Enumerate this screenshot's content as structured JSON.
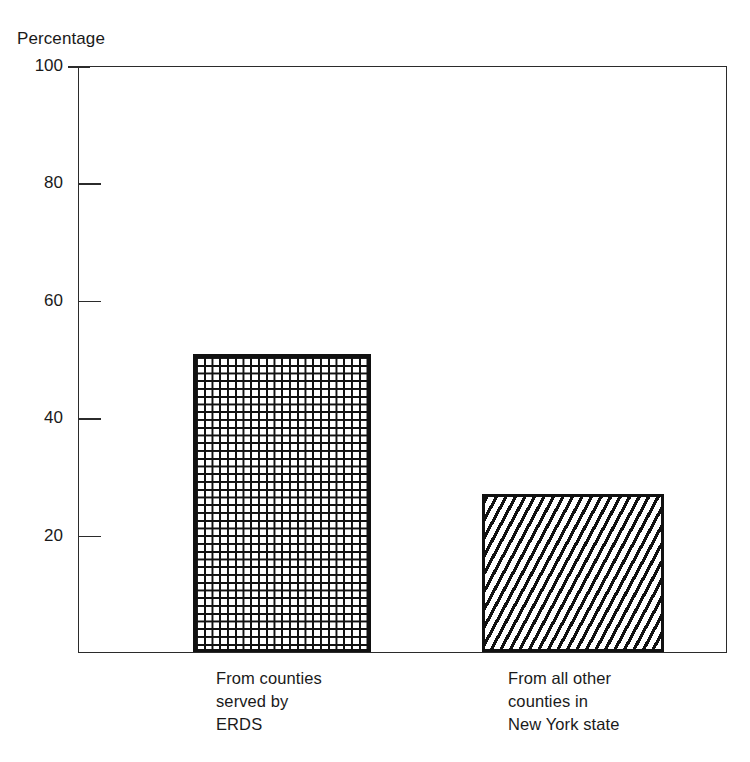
{
  "chart_data": {
    "type": "bar",
    "title": "",
    "subtitle": "",
    "xlabel": "",
    "ylabel": "Percentage",
    "ylim": [
      0,
      100
    ],
    "yticks": [
      100,
      80,
      60,
      40,
      20
    ],
    "ytick_labels": [
      "100",
      "80",
      "60",
      "40",
      "20"
    ],
    "grid": false,
    "legend": null,
    "categories": [
      "From counties\nserved by\nERDS",
      "From all other\ncounties in\nNew York state"
    ],
    "values": [
      51,
      27
    ],
    "bar_patterns": [
      "basketweave",
      "diagonal-hatch"
    ],
    "colors": {
      "line": "#2b2b2b",
      "bar_edge": "#111111",
      "bar_fill": "#ffffff",
      "text": "#1a1a1a",
      "background": "#ffffff"
    }
  },
  "axis": {
    "y_title": "Percentage",
    "ticks": [
      {
        "label": "100",
        "value": 100
      },
      {
        "label": "80",
        "value": 80
      },
      {
        "label": "60",
        "value": 60
      },
      {
        "label": "40",
        "value": 40
      },
      {
        "label": "20",
        "value": 20
      }
    ]
  },
  "bars": [
    {
      "label_line1": "From counties",
      "label_line2": "served by",
      "label_line3": "ERDS",
      "value": 51,
      "pattern": "basketweave"
    },
    {
      "label_line1": "From all other",
      "label_line2": "counties in",
      "label_line3": "New York state",
      "value": 27,
      "pattern": "diagonal-hatch"
    }
  ]
}
